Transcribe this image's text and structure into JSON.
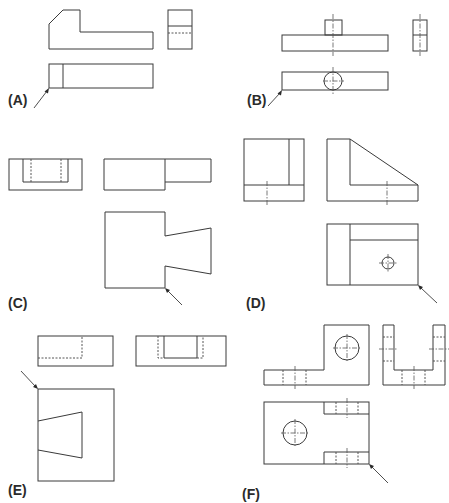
{
  "figure": {
    "panels": [
      {
        "id": "A",
        "label": "(A)",
        "views": [
          "front",
          "right-side",
          "top"
        ],
        "arrow_target": "bottom-left corner of top view"
      },
      {
        "id": "B",
        "label": "(B)",
        "views": [
          "front",
          "right-side",
          "top"
        ],
        "arrow_target": "bottom-left corner of top view"
      },
      {
        "id": "C",
        "label": "(C)",
        "views": [
          "left-side",
          "front",
          "top"
        ],
        "arrow_target": "bottom corner of top view notch"
      },
      {
        "id": "D",
        "label": "(D)",
        "views": [
          "left-side",
          "front",
          "top"
        ],
        "arrow_target": "bottom-right corner of top view"
      },
      {
        "id": "E",
        "label": "(E)",
        "views": [
          "front",
          "right-side",
          "top"
        ],
        "arrow_target": "top-left corner of top view"
      },
      {
        "id": "F",
        "label": "(F)",
        "views": [
          "front",
          "right-side",
          "top"
        ],
        "arrow_target": "bottom-right corner of top view"
      }
    ]
  },
  "colors": {
    "line": "#3a3a3a",
    "background": "#ffffff"
  }
}
